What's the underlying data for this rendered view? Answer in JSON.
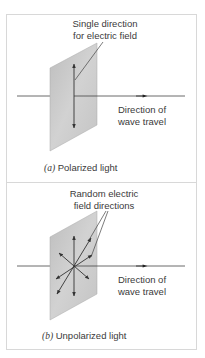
{
  "panels": [
    {
      "id": "a",
      "annotation": [
        "Single direction",
        "for electric field"
      ],
      "direction_label": [
        "Direction of",
        "wave travel"
      ],
      "caption_letter": "(a)",
      "caption_text": "Polarized light"
    },
    {
      "id": "b",
      "annotation": [
        "Random electric",
        "field directions"
      ],
      "direction_label": [
        "Direction of",
        "wave travel"
      ],
      "caption_letter": "(b)",
      "caption_text": "Unpolarized light"
    }
  ],
  "colors": {
    "plate": "#c8c8c8",
    "line": "#333333",
    "border": "#d8d8d8"
  }
}
